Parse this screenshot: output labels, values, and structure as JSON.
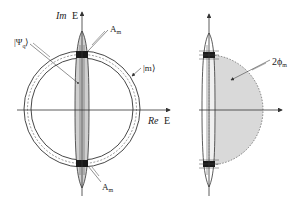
{
  "left_diagram": {
    "axis_y_label_italic": "Im",
    "axis_y_label": "E",
    "axis_x_label_italic": "Re",
    "axis_x_label": "E",
    "psi_label": "|Ψ",
    "psi_sub": "q",
    "psi_close": "⟩",
    "m_label": "|m⟩",
    "a_top_label": "A",
    "a_top_sub": "m",
    "a_bottom_label": "A",
    "a_bottom_sub": "m"
  },
  "right_diagram": {
    "phase_label": "2ϕ",
    "phase_sub": "m"
  },
  "colors": {
    "line": "#333333",
    "shade": "#d9d9d9",
    "dark_block": "#1a1a1a",
    "ring_dash": "#555555"
  }
}
